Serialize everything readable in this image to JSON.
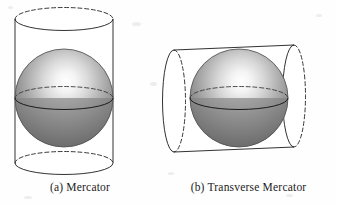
{
  "figure": {
    "background_color": "#fefefe",
    "line_color": "#1b1b1b"
  },
  "panels": [
    {
      "id": "mercator",
      "caption": "(a) Mercator",
      "cylinder_orientation": "vertical",
      "sphere_label": "globe",
      "tangent_line": "equator"
    },
    {
      "id": "transverse-mercator",
      "caption": "(b) Transverse Mercator",
      "cylinder_orientation": "horizontal",
      "sphere_label": "globe",
      "tangent_line": "meridian"
    }
  ],
  "shading": {
    "sphere_highlight": "#fdfdfd",
    "sphere_mid": "#a9a9a9",
    "sphere_dark": "#4e4e4e",
    "sphere_edge": "#6f6f6f",
    "cylinder_fill": "#ffffff"
  }
}
